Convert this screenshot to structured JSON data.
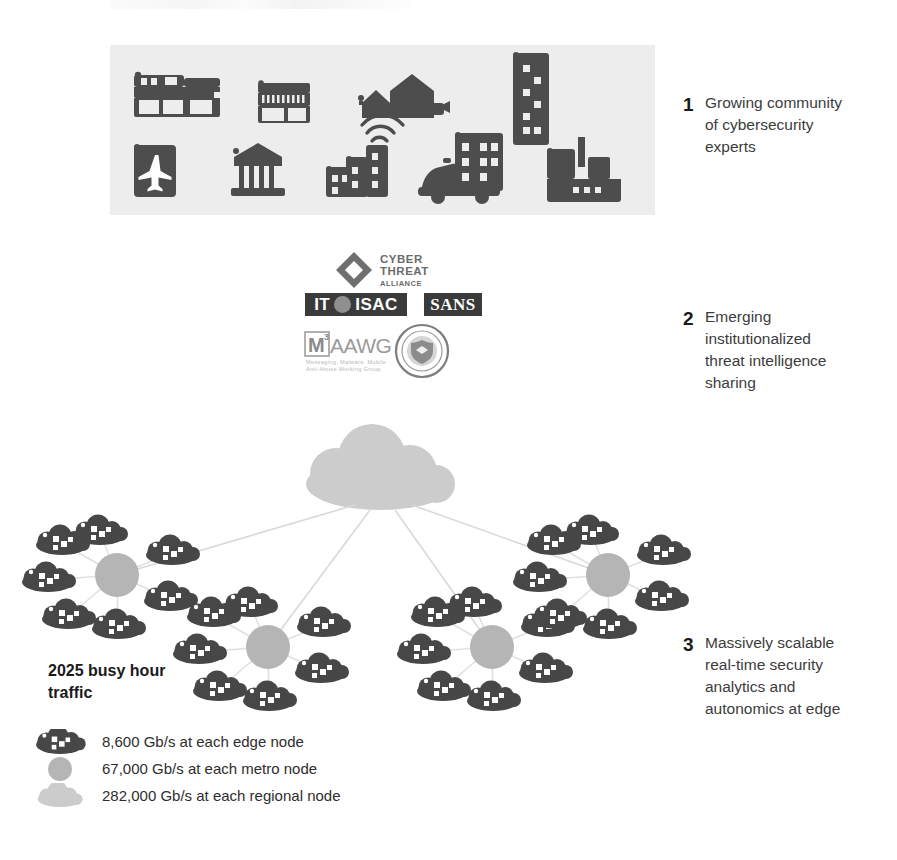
{
  "document": {
    "title": "Network security evolution infographic"
  },
  "section1": {
    "name": "industry-icon-panel",
    "background_color": "#ededed",
    "icon_color": "#4d4d4d",
    "icons": [
      "office-building-icon",
      "storefront-icon",
      "residential-homes-icon",
      "highrise-tower-icon",
      "airport-icon",
      "bank-icon",
      "connected-buildings-wifi-icon",
      "police-car-icon",
      "apartment-building-icon",
      "factory-icon"
    ]
  },
  "arrow": {
    "name": "down-arrow",
    "color": "#d4d4d4"
  },
  "section2": {
    "name": "threat-intel-logos",
    "logos": [
      {
        "id": "cyber-threat-alliance-logo",
        "line1": "CYBER",
        "line2": "THREAT",
        "line3": "ALLIANCE"
      },
      {
        "id": "it-isac-logo",
        "text_left": "IT",
        "text_right": "ISAC"
      },
      {
        "id": "sans-logo",
        "text": "SANS"
      },
      {
        "id": "m3aawg-logo",
        "mark": "M",
        "superscript": "3",
        "wordmark": "AAWG",
        "tagline1": "Messaging, Malware, Mobile",
        "tagline2": "Anti-Abuse Working Group"
      },
      {
        "id": "dhs-seal-logo",
        "text_top": "U.S. DEPARTMENT OF",
        "text_bottom": "HOMELAND SECURITY"
      }
    ]
  },
  "section3": {
    "name": "network-topology",
    "regional_cloud_color": "#cccccc",
    "metro_node_color": "#b5b5b5",
    "edge_cloud_color": "#474747",
    "link_color": "#d9d9d9",
    "metro_cluster_count": 4,
    "edge_nodes_per_metro": 7
  },
  "callouts": [
    {
      "number": "1",
      "text": "Growing community\nof cybersecurity\nexperts"
    },
    {
      "number": "2",
      "text": "Emerging\ninstitutionalized\nthreat intelligence\nsharing"
    },
    {
      "number": "3",
      "text": "Massively scalable\nreal-time security\nanalytics and\nautonomics at edge"
    }
  ],
  "legend": {
    "title": "2025 busy hour\ntraffic",
    "rows": [
      {
        "swatch": "edge-cloud-swatch",
        "label": "8,600 Gb/s at each edge node"
      },
      {
        "swatch": "metro-node-swatch",
        "label": "67,000 Gb/s at each metro node"
      },
      {
        "swatch": "regional-cloud-swatch",
        "label": "282,000 Gb/s at each regional node"
      }
    ]
  }
}
